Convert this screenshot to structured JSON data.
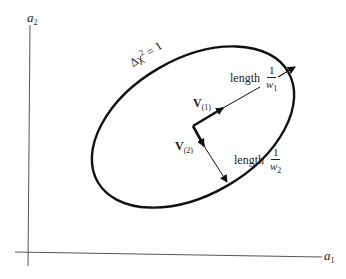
{
  "diagram": {
    "type": "confidence-ellipse",
    "axes": {
      "x_label": "a",
      "x_sub": "1",
      "y_label": "a",
      "y_sub": "2"
    },
    "contour_label": {
      "prefix": "Δχ",
      "sup": "2",
      "suffix": " = 1"
    },
    "vectors": [
      {
        "name": "V",
        "sub": "(1)",
        "length_word": "length",
        "frac_num": "1",
        "frac_den": "w",
        "frac_den_sub": "1"
      },
      {
        "name": "V",
        "sub": "(2)",
        "length_word": "length",
        "frac_num": "1",
        "frac_den": "w",
        "frac_den_sub": "2"
      }
    ],
    "colors": {
      "ink": "#111111",
      "axis": "#555555"
    }
  }
}
